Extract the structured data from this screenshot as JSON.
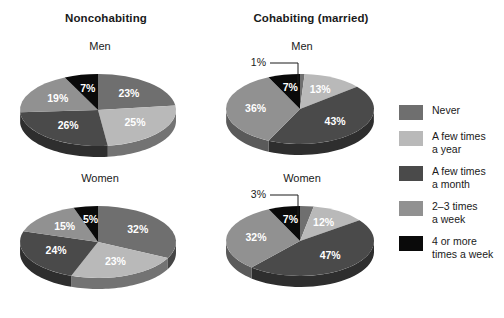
{
  "chart_data": {
    "type": "pie",
    "title": "",
    "legend_position": "right",
    "categories": [
      "Never",
      "A few times a year",
      "A few times a month",
      "2–3 times a week",
      "4 or more times a week"
    ],
    "colors": [
      "#6f6f6f",
      "#b9b9b9",
      "#4a4a4a",
      "#919191",
      "#0a0a0a"
    ],
    "charts": [
      {
        "group": "Noncohabiting",
        "panel": "Men",
        "values": [
          23,
          25,
          26,
          19,
          7
        ],
        "labels": [
          "23%",
          "25%",
          "26%",
          "19%",
          "7%"
        ]
      },
      {
        "group": "Cohabiting (married)",
        "panel": "Men",
        "values": [
          1,
          13,
          43,
          36,
          7
        ],
        "labels": [
          "1%",
          "13%",
          "43%",
          "36%",
          "7%"
        ]
      },
      {
        "group": "Noncohabiting",
        "panel": "Women",
        "values": [
          32,
          23,
          24,
          15,
          5
        ],
        "labels": [
          "32%",
          "23%",
          "24%",
          "15%",
          "5%"
        ]
      },
      {
        "group": "Cohabiting (married)",
        "panel": "Women",
        "values": [
          3,
          12,
          47,
          32,
          7
        ],
        "labels": [
          "3%",
          "12%",
          "47%",
          "32%",
          "7%"
        ]
      }
    ]
  },
  "headers": {
    "left": "Noncohabiting",
    "right": "Cohabiting (married)"
  },
  "panels": {
    "top_left": "Men",
    "top_right": "Men",
    "bottom_left": "Women",
    "bottom_right": "Women"
  },
  "legend": {
    "items": [
      {
        "label": "Never",
        "color": "#6f6f6f"
      },
      {
        "label": "A few times\na year",
        "color": "#b9b9b9"
      },
      {
        "label": "A few times\na month",
        "color": "#4a4a4a"
      },
      {
        "label": "2–3 times\na week",
        "color": "#919191"
      },
      {
        "label": "4 or more\ntimes a week",
        "color": "#0a0a0a"
      }
    ]
  }
}
